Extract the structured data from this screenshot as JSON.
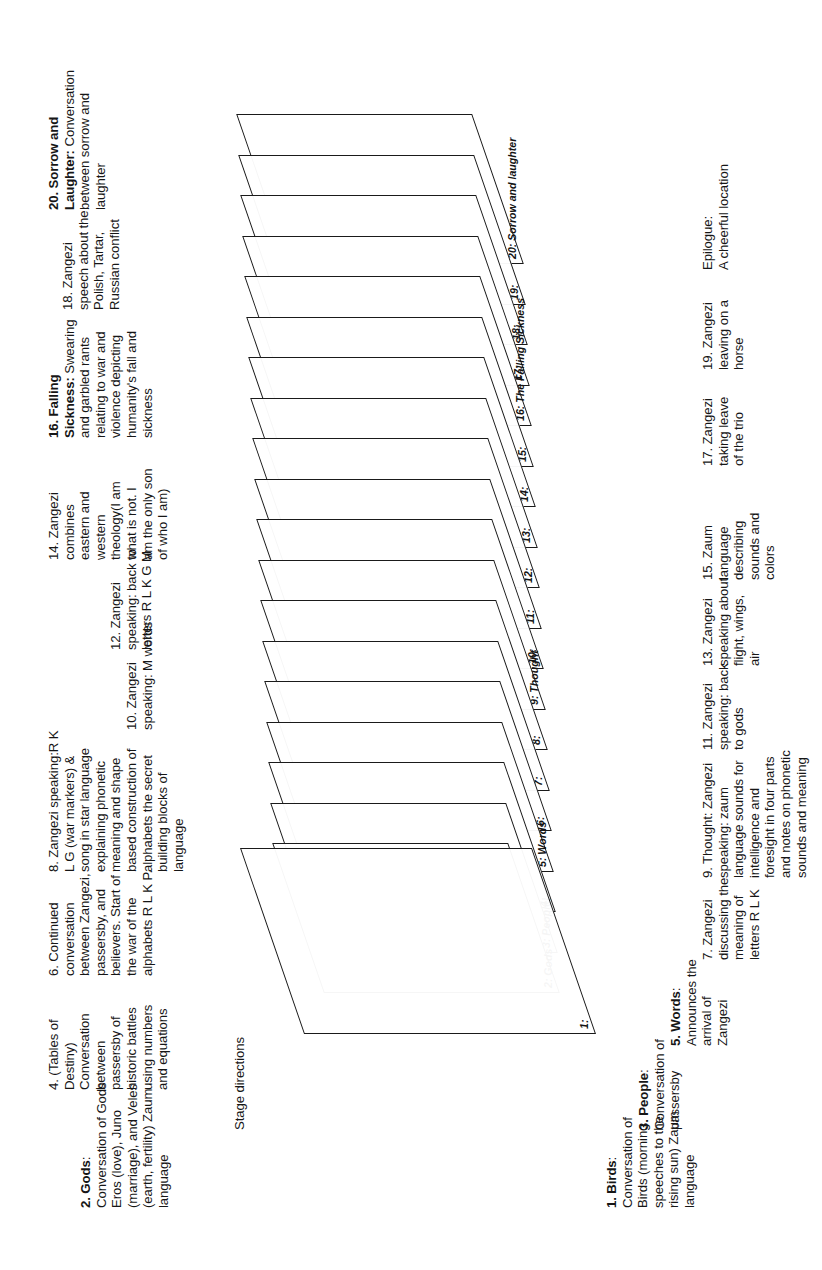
{
  "figure": {
    "orientation": "rotated-90-ccw",
    "line_color": "#1a1a1a",
    "text_color": "#161616",
    "background": "#ffffff"
  },
  "planes": [
    {
      "id": 1,
      "label": "1:"
    },
    {
      "id": 2,
      "label": "2: Gods"
    },
    {
      "id": 3,
      "label": "3: People:"
    },
    {
      "id": 4,
      "label": "4:"
    },
    {
      "id": 5,
      "label": "5: Words"
    },
    {
      "id": 6,
      "label": "6:"
    },
    {
      "id": 7,
      "label": "7:"
    },
    {
      "id": 8,
      "label": "8:"
    },
    {
      "id": 9,
      "label": "9: Thought"
    },
    {
      "id": 10,
      "label": "10:"
    },
    {
      "id": 11,
      "label": "11:"
    },
    {
      "id": 12,
      "label": "12:"
    },
    {
      "id": 13,
      "label": "13:"
    },
    {
      "id": 14,
      "label": "14:"
    },
    {
      "id": 15,
      "label": "15:"
    },
    {
      "id": 16,
      "label": "16: The Falling Sickness"
    },
    {
      "id": 17,
      "label": "17:"
    },
    {
      "id": 18,
      "label": "18:"
    },
    {
      "id": 19,
      "label": "19:"
    },
    {
      "id": 20,
      "label": "20: Sorrow and laughter"
    }
  ],
  "annotations_upper": [
    {
      "key": "a1",
      "text": "1. Birds:\nConversation of\nBirds (morning\nspeeches to the\nrising sun) Zaum\nlanguage",
      "bold_prefix": "1. Birds"
    },
    {
      "key": "a3",
      "text": "3. People:\nConversation of\npassersby",
      "bold_prefix": "3. People"
    },
    {
      "key": "a5",
      "text": "5. Words:\nAnnounces the\narrival of\nZangezi",
      "bold_prefix": "5. Words"
    },
    {
      "key": "a7",
      "text": "7. Zangezi\ndiscussing the\nmeaning of\nletters R L K"
    },
    {
      "key": "a9",
      "text": "9. Thought: Zangezi\nspeaking: zaum\nlanguage sounds for\nintelligence and\nforesight in four parts\nand notes on phonetic\nsounds and meaning"
    },
    {
      "key": "a11",
      "text": "11. Zangezi\nspeaking: back\nto gods"
    },
    {
      "key": "a13",
      "text": "13. Zangezi\nspeaking about\nflight, wings,\nair"
    },
    {
      "key": "a15",
      "text": "15. Zaum\nlanguage\ndescribing\nsounds and\ncolors"
    },
    {
      "key": "a17",
      "text": "17. Zangezi\ntaking leave\nof the trio"
    },
    {
      "key": "a19",
      "text": "19. Zangezi\nleaving on a\nhorse"
    },
    {
      "key": "aep",
      "text": "Epilogue:\nA cheerful location"
    }
  ],
  "annotations_lower": [
    {
      "key": "b_stage",
      "text": "Stage directions"
    },
    {
      "key": "b2",
      "text": "2. Gods:\nConversation of Gods\nEros (love), Juno\n(marriage), and Veles\n(earth, fertility) Zaum\nlanguage",
      "bold_prefix": "2. Gods"
    },
    {
      "key": "b4",
      "text": "4. (Tables of\nDestiny)\nConversation\nbetween\npassersby of\nhistoric battles\nusing numbers\nand equations"
    },
    {
      "key": "b6",
      "text": "6. Continued\nconversation\nbetween Zangezi,\npassersby, and\nbelievers. Start of\nthe war of the\nalphabets R L K P."
    },
    {
      "key": "b8",
      "text": "8. Zangezi speaking:R K\nL G (war markers) &\nsong in star language\nexplaining phonetic\nmeaning and shape\nbased construction of\nalphabets the secret\nbuilding blocks of\nlanguage"
    },
    {
      "key": "b10",
      "text": "10. Zangezi\nspeaking: M words"
    },
    {
      "key": "b12",
      "text": "12. Zangezi\nspeaking: back to\nletters R L K G M"
    },
    {
      "key": "b14",
      "text": "14. Zangezi\ncombines\neastern and\nwestern\ntheology(I am\nwhat is not. I\nam the only son\nof who I am)"
    },
    {
      "key": "b16",
      "text": "16. Falling\nSickness: Swearing\nand garbled rants\nrelating to war and\nviolence depicting\nhumanity's fall and\nsickness",
      "bold_prefix": "16. Falling Sickness"
    },
    {
      "key": "b18",
      "text": "18. Zangezi\nspeech about the\nPolish, Tartar,\nRussian conflict"
    },
    {
      "key": "b20",
      "text": "20. Sorrow and\nLaughter: Conversation\nbetween sorrow and\nlaughter",
      "bold_prefix": "20. Sorrow and Laughter"
    }
  ]
}
